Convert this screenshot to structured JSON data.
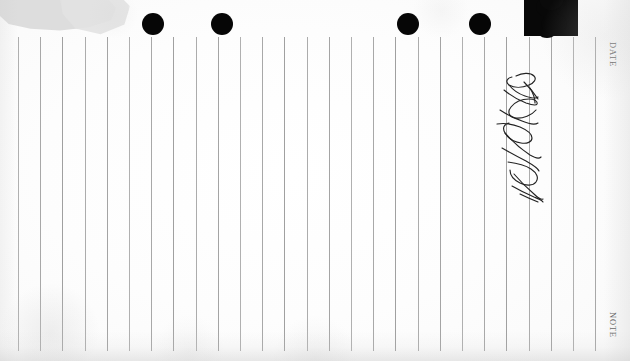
{
  "document": {
    "kind": "scanned-ruled-notepaper",
    "paper_color": "#fdfdfd",
    "rule_color": "#9c9c9c",
    "ink_color": "#1c1c1c",
    "width": 630,
    "height": 361
  },
  "edge_labels": {
    "date": "DATE",
    "note": "NOTE"
  },
  "rules": {
    "count": 27,
    "first_x": 18,
    "spacing": 22.2,
    "top_y": 37,
    "bottom_y": 351
  },
  "punch_holes": [
    {
      "name": "hole-1",
      "cx": 153,
      "cy": 24,
      "r": 11
    },
    {
      "name": "hole-2",
      "cx": 222,
      "cy": 24,
      "r": 11
    },
    {
      "name": "hole-3",
      "cx": 408,
      "cy": 24,
      "r": 11
    },
    {
      "name": "hole-4",
      "cx": 480,
      "cy": 24,
      "r": 11
    },
    {
      "name": "hole-5",
      "cx": 547,
      "cy": 26,
      "r": 12
    }
  ],
  "ink_blot": {
    "name": "ink-blot-top-right",
    "x": 528,
    "y": 0,
    "width": 44,
    "height": 28
  },
  "handwriting": {
    "name": "vertical-signature-scribble",
    "transcription": "",
    "x": 486,
    "y": 66,
    "width": 78,
    "height": 140
  },
  "corner_damage": {
    "name": "torn-top-left-corner",
    "color": "#dcdcdc"
  }
}
